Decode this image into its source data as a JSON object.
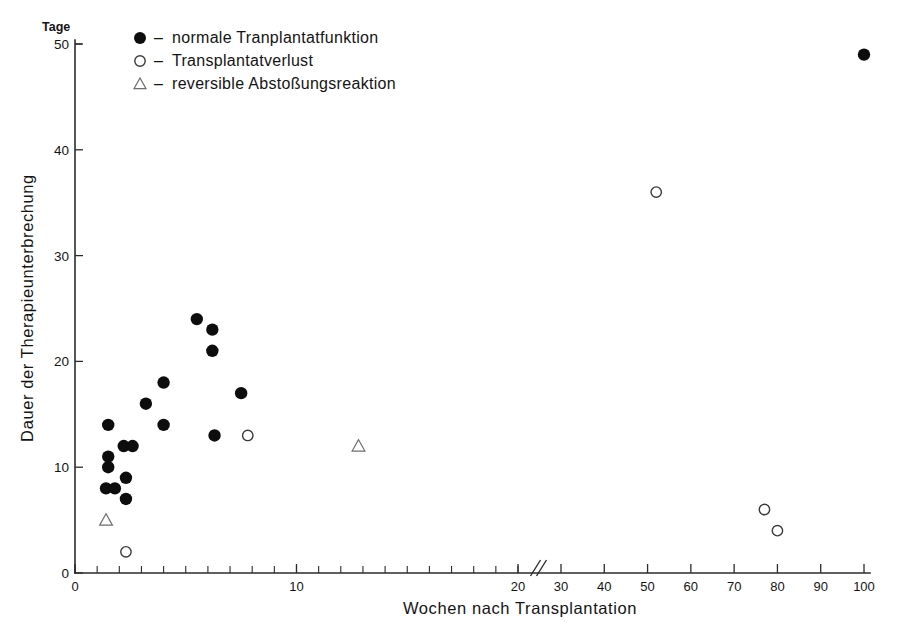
{
  "chart_data": {
    "type": "scatter",
    "title": "",
    "xlabel": "Wochen nach Transplantation",
    "ylabel": "Dauer der Therapieunterbrechung",
    "yunit": "Tage",
    "ylim": [
      0,
      50
    ],
    "yticks": [
      0,
      10,
      20,
      30,
      40,
      50
    ],
    "xlim": [
      0,
      100
    ],
    "xticks_labeled": [
      0,
      10,
      20,
      30,
      40,
      50,
      60,
      70,
      80,
      90,
      100
    ],
    "x_minor_tick_step": 1,
    "x_minor_tick_range": [
      0,
      20
    ],
    "axis_break": {
      "present": true,
      "between": [
        20,
        30
      ],
      "marker": "//"
    },
    "grid": false,
    "legend_position": "top-left",
    "series": [
      {
        "name": "normale Tranplantatfunktion",
        "marker": "filled-circle",
        "points": [
          {
            "x": 1.5,
            "y": 14
          },
          {
            "x": 1.5,
            "y": 11
          },
          {
            "x": 1.5,
            "y": 10
          },
          {
            "x": 1.4,
            "y": 8
          },
          {
            "x": 1.8,
            "y": 8
          },
          {
            "x": 2.2,
            "y": 12
          },
          {
            "x": 2.6,
            "y": 12
          },
          {
            "x": 2.3,
            "y": 9
          },
          {
            "x": 2.3,
            "y": 7
          },
          {
            "x": 3.2,
            "y": 16
          },
          {
            "x": 4.0,
            "y": 18
          },
          {
            "x": 4.0,
            "y": 14
          },
          {
            "x": 5.5,
            "y": 24
          },
          {
            "x": 6.2,
            "y": 23
          },
          {
            "x": 6.2,
            "y": 21
          },
          {
            "x": 6.3,
            "y": 13
          },
          {
            "x": 7.5,
            "y": 17
          },
          {
            "x": 100,
            "y": 49
          }
        ]
      },
      {
        "name": "Transplantatverlust",
        "marker": "open-circle",
        "points": [
          {
            "x": 2.3,
            "y": 2
          },
          {
            "x": 7.8,
            "y": 13
          },
          {
            "x": 52,
            "y": 36
          },
          {
            "x": 77,
            "y": 6
          },
          {
            "x": 80,
            "y": 4
          }
        ]
      },
      {
        "name": "reversible Abstoßungsreaktion",
        "marker": "open-triangle",
        "points": [
          {
            "x": 1.4,
            "y": 5
          },
          {
            "x": 12.8,
            "y": 12
          }
        ]
      }
    ]
  },
  "legend": {
    "items": [
      {
        "marker": "filled-circle",
        "dash": "–",
        "label": "normale  Tranplantatfunktion"
      },
      {
        "marker": "open-circle",
        "dash": "–",
        "label": "Transplantatverlust"
      },
      {
        "marker": "open-triangle",
        "dash": "–",
        "label": "reversible Abstoßungsreaktion"
      }
    ]
  }
}
